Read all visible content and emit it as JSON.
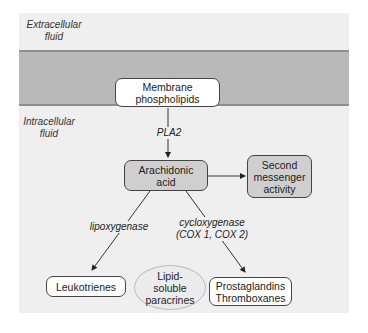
{
  "regions": {
    "extracellular": "Extracellular fluid",
    "extracellular_lines": [
      "Extracellular",
      "fluid"
    ],
    "intracellular_lines": [
      "Intracellular",
      "fluid"
    ]
  },
  "nodes": {
    "membrane_phospholipids": [
      "Membrane",
      "phospholipids"
    ],
    "arachidonic_acid": [
      "Arachidonic",
      "acid"
    ],
    "second_messenger": [
      "Second",
      "messenger",
      "activity"
    ],
    "leukotrienes": [
      "Leukotrienes"
    ],
    "lipid_soluble_paracrines": [
      "Lipid-",
      "soluble",
      "paracrines"
    ],
    "prostaglandins_thromboxanes": [
      "Prostaglandins",
      "Thromboxanes"
    ]
  },
  "enzymes": {
    "pla2": "PLA2",
    "lipoxygenase": "lipoxygenase",
    "cyclooxygenase_lines": [
      "cycloxygenase",
      "(COX 1, COX 2)"
    ]
  },
  "colors": {
    "membrane": "#b9b9b9",
    "background_panel": "#efefef",
    "grey_box": "#cfcfcf",
    "white_box": "#ffffff"
  }
}
